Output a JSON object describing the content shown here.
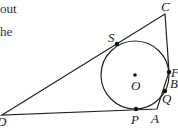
{
  "text_fragments": [
    "out",
    "he"
  ],
  "diagram": {
    "labels": {
      "C": "C",
      "S": "S",
      "O": "O",
      "F": "F",
      "B": "B",
      "Q": "Q",
      "P": "P",
      "A": "A",
      "D": "D"
    }
  }
}
